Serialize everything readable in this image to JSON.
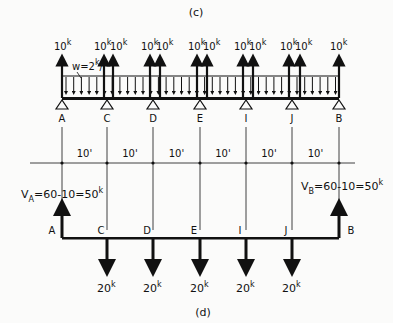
{
  "panel_c": {
    "label": "(c)",
    "load_label": "w=2",
    "load_unit": "k",
    "load_suffix": "/'",
    "point_load_value": "10",
    "point_load_unit": "k",
    "supports": [
      "A",
      "C",
      "D",
      "E",
      "I",
      "J",
      "B"
    ]
  },
  "dimensions": {
    "spans": [
      "10'",
      "10'",
      "10'",
      "10'",
      "10'",
      "10'"
    ]
  },
  "panel_d": {
    "label": "(d)",
    "va_prefix": "V",
    "va_sub": "A",
    "va_expr": "=60-10=50",
    "vb_prefix": "V",
    "vb_sub": "B",
    "vb_expr": "=60-10=50",
    "unit": "k",
    "nodes": [
      "A",
      "C",
      "D",
      "E",
      "I",
      "J",
      "B"
    ],
    "down_load_value": "20",
    "down_load_unit": "k"
  },
  "colors": {
    "ink": "#111111",
    "background": "#fbfbfa"
  }
}
